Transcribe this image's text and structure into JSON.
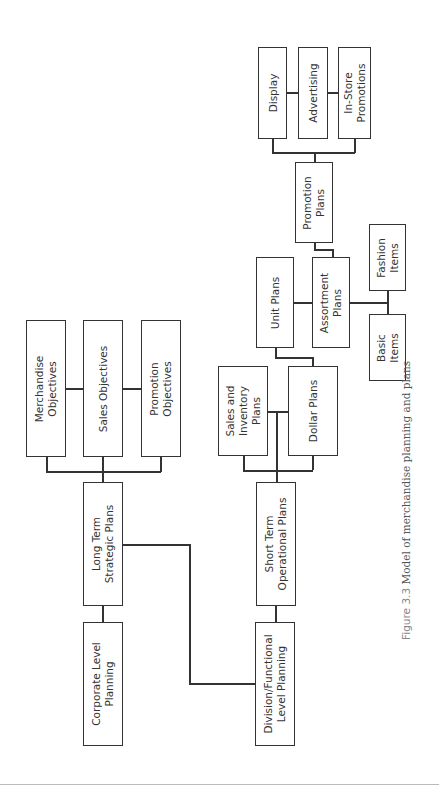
{
  "diagram": {
    "title": "Model of merchandise planning and plans",
    "nodes": {
      "corporate": "Corporate Level\nPlanning",
      "long_term": "Long Term\nStrategic Plans",
      "merch_obj": "Merchandise\nObjectives",
      "sales_obj": "Sales Objectives",
      "promo_obj": "Promotion\nObjectives",
      "division": "Division/Functional\nLevel Planning",
      "short_term": "Short Term\nOperational Plans",
      "sales_inv": "Sales and\nInventory\nPlans",
      "dollar": "Dollar Plans",
      "unit": "Unit Plans",
      "assortment": "Assortment\nPlans",
      "basic": "Basic\nItems",
      "fashion": "Fashion\nItems",
      "promotion": "Promotion\nPlans",
      "display": "Display",
      "advertising": "Advertising",
      "instore": "In-Store\nPromotions"
    },
    "edges": [
      [
        "corporate",
        "long_term"
      ],
      [
        "long_term",
        "merch_obj"
      ],
      [
        "long_term",
        "sales_obj"
      ],
      [
        "long_term",
        "promo_obj"
      ],
      [
        "long_term",
        "division"
      ],
      [
        "division",
        "short_term"
      ],
      [
        "short_term",
        "sales_inv"
      ],
      [
        "short_term",
        "dollar"
      ],
      [
        "dollar",
        "unit"
      ],
      [
        "unit",
        "assortment"
      ],
      [
        "assortment",
        "basic"
      ],
      [
        "assortment",
        "fashion"
      ],
      [
        "assortment",
        "promotion"
      ],
      [
        "promotion",
        "display"
      ],
      [
        "promotion",
        "advertising"
      ],
      [
        "promotion",
        "instore"
      ]
    ]
  },
  "caption": {
    "figure_label": "Figure 3.3",
    "text": " Model of merchandise planning and plans"
  }
}
